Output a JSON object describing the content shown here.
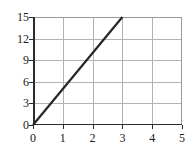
{
  "chart_data": {
    "type": "line",
    "title": "",
    "xlabel": "",
    "ylabel": "",
    "xlim": [
      0,
      5
    ],
    "ylim": [
      0,
      15
    ],
    "grid": true,
    "legend": "none",
    "xticks": [
      "0",
      "1",
      "2",
      "3",
      "4",
      "5"
    ],
    "xtick_values": [
      0,
      1,
      2,
      3,
      4,
      5
    ],
    "yticks": [
      "0",
      "3",
      "6",
      "9",
      "12",
      "15"
    ],
    "ytick_values": [
      0,
      3,
      6,
      9,
      12,
      15
    ],
    "series": [
      {
        "name": "line",
        "color": "#262626",
        "x": [
          0,
          3
        ],
        "y": [
          0,
          15
        ],
        "points": [
          [
            0,
            0
          ],
          [
            1,
            5
          ],
          [
            2,
            10
          ],
          [
            3,
            15
          ]
        ],
        "slope": 5,
        "intercept": 0
      }
    ]
  },
  "axes": {
    "x_tick_labels": [
      "0",
      "1",
      "2",
      "3",
      "4",
      "5"
    ],
    "y_tick_labels": [
      "0",
      "3",
      "6",
      "9",
      "12",
      "15"
    ]
  },
  "colors": {
    "background": "#ffffff",
    "grid": "#b3b3b3",
    "axis": "#2b2b2b",
    "series": "#262626",
    "frame": "#9a9a9a"
  }
}
